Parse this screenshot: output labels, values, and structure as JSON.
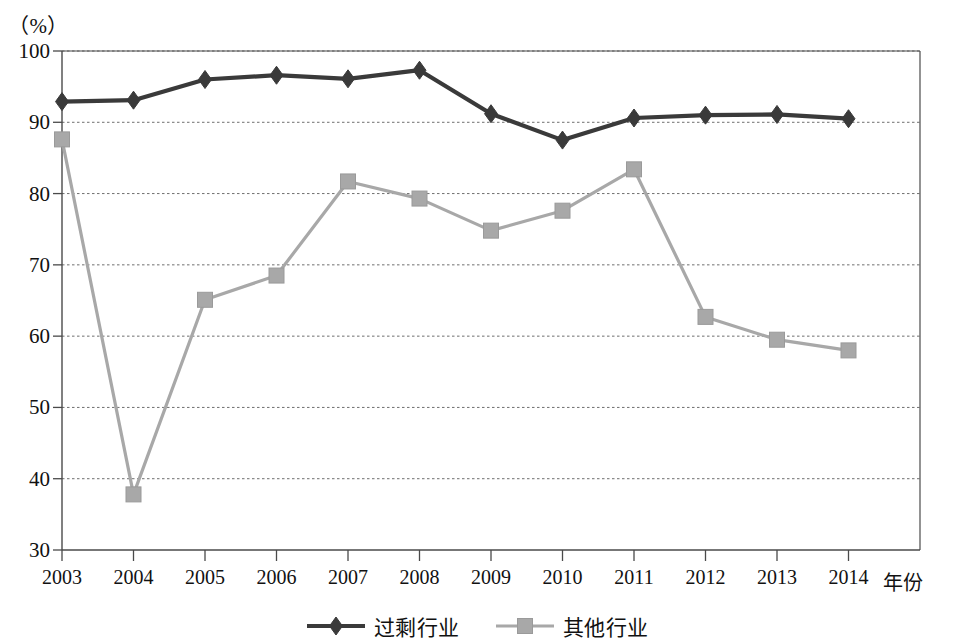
{
  "chart_data": {
    "type": "line",
    "title": "",
    "subtitle": "",
    "unit_label": "（%）",
    "xlabel": "年份",
    "ylabel": "",
    "categories": [
      "2003",
      "2004",
      "2005",
      "2006",
      "2007",
      "2008",
      "2009",
      "2010",
      "2011",
      "2012",
      "2013",
      "2014"
    ],
    "x_tick_labels": [
      "2003",
      "2004",
      "2005",
      "2006",
      "2007",
      "2008",
      "2009",
      "2010",
      "2011",
      "2012",
      "2013",
      "2014"
    ],
    "y_tick_labels": [
      "100",
      "90",
      "80",
      "70",
      "60",
      "50",
      "40",
      "30"
    ],
    "y_ticks": [
      100,
      90,
      80,
      70,
      60,
      50,
      40,
      30
    ],
    "ylim": [
      30,
      100
    ],
    "grid": true,
    "grid_axis": "y",
    "legend_position": "bottom",
    "series": [
      {
        "name": "过剩行业",
        "marker": "diamond",
        "color": "#3a3a3a",
        "values": [
          92.9,
          93.1,
          96.0,
          96.6,
          96.1,
          97.3,
          91.2,
          87.5,
          90.6,
          91.0,
          91.1,
          90.5
        ]
      },
      {
        "name": "其他行业",
        "marker": "square",
        "color": "#a8a8a8",
        "values": [
          87.6,
          37.8,
          65.1,
          68.5,
          81.7,
          79.3,
          74.8,
          77.6,
          83.4,
          62.7,
          59.5,
          58.0
        ]
      }
    ]
  },
  "legend": {
    "entries": [
      {
        "label": "过剩行业",
        "marker": "diamond-marker-icon",
        "color": "#3a3a3a"
      },
      {
        "label": "其他行业",
        "marker": "square-marker-icon",
        "color": "#a8a8a8"
      }
    ]
  },
  "axes": {
    "unit": "（%）",
    "x_title": "年份"
  },
  "colors": {
    "series_overcapacity": "#3a3a3a",
    "series_other": "#a8a8a8",
    "axis": "#4a4a4a",
    "grid": "#6e6e6e",
    "background": "#ffffff"
  }
}
